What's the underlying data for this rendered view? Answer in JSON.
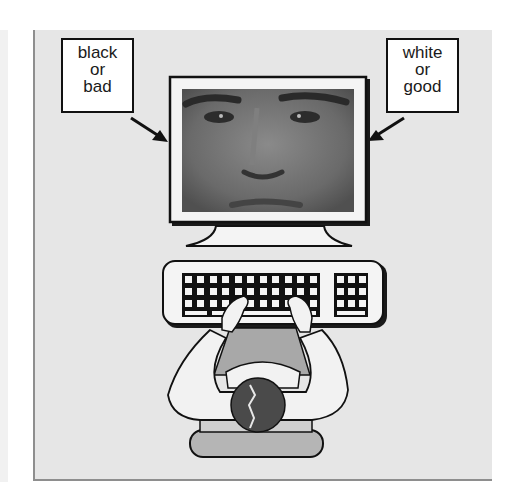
{
  "diagram": {
    "type": "implicit-association-test-illustration",
    "left_label": {
      "lines": [
        "black",
        "or",
        "bad"
      ]
    },
    "right_label": {
      "lines": [
        "white",
        "or",
        "good"
      ]
    },
    "screen_content": "face-photo",
    "elements": [
      "monitor",
      "keyboard",
      "person-typing",
      "chair"
    ]
  },
  "colors": {
    "panel_bg": "#e6e6e6",
    "panel_border": "#8e8e8e",
    "outline": "#111111",
    "face_tone": "#6f6f6f",
    "shirt": "#f2f2f2",
    "vest": "#a8a8a8",
    "hair": "#4a4a4a",
    "chair": "#b5b5b5"
  }
}
